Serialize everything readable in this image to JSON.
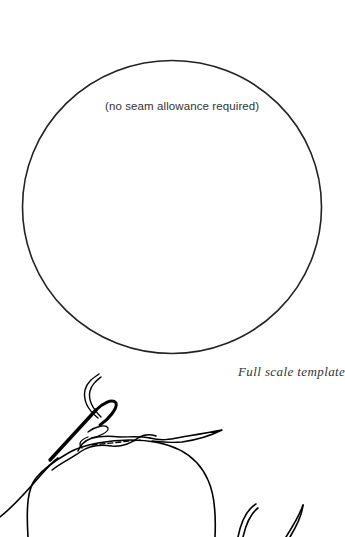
{
  "template": {
    "shape": "circle",
    "note": "(no seam allowance required)",
    "stroke_color": "#222222",
    "center": [
      172,
      207
    ],
    "radius_x": 150,
    "radius_y": 147
  },
  "caption": "Full scale template",
  "illustration": {
    "subject": "needle-and-thread-sewing-running-stitch-around-circle",
    "ink_color": "#000000"
  }
}
